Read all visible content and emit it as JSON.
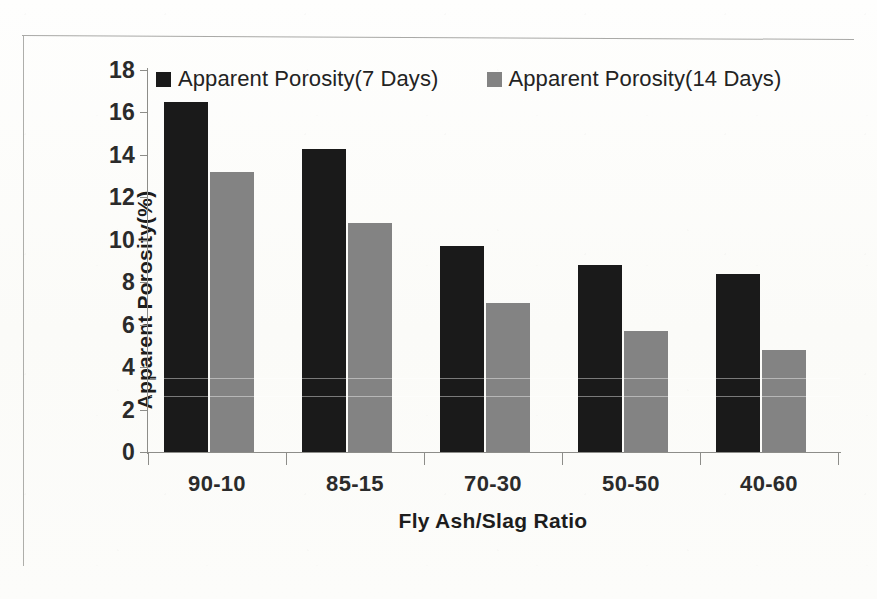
{
  "chart_data": {
    "type": "bar",
    "title": "",
    "subtitle": "",
    "xlabel": "Fly Ash/Slag Ratio",
    "ylabel": "Apparent Porosity(%)",
    "categories": [
      "90-10",
      "85-15",
      "70-30",
      "50-50",
      "40-60"
    ],
    "series": [
      {
        "name": "Apparent Porosity(7 Days)",
        "color": "#1a1a1a",
        "values": [
          16.5,
          14.3,
          9.7,
          8.8,
          8.4
        ]
      },
      {
        "name": "Apparent Porosity(14 Days)",
        "color": "#838383",
        "values": [
          13.2,
          10.8,
          7.0,
          5.7,
          4.8
        ]
      }
    ],
    "ylim": [
      0,
      18
    ],
    "ytick_step": 2,
    "yticks": [
      0,
      2,
      4,
      6,
      8,
      10,
      12,
      14,
      16,
      18
    ],
    "grid": false,
    "legend_position": "top-inside-left"
  },
  "legend": {
    "items": [
      {
        "label": "Apparent Porosity(7 Days)",
        "swatch": "legend-swatch-dark"
      },
      {
        "label": "Apparent Porosity(14 Days)",
        "swatch": "legend-swatch-gray"
      }
    ]
  },
  "colors": {
    "series_7_days": "#1a1a1a",
    "series_14_days": "#838383",
    "axis": "#8d8d89",
    "text": "#1d1d1d",
    "background": "#fdfdfb"
  }
}
